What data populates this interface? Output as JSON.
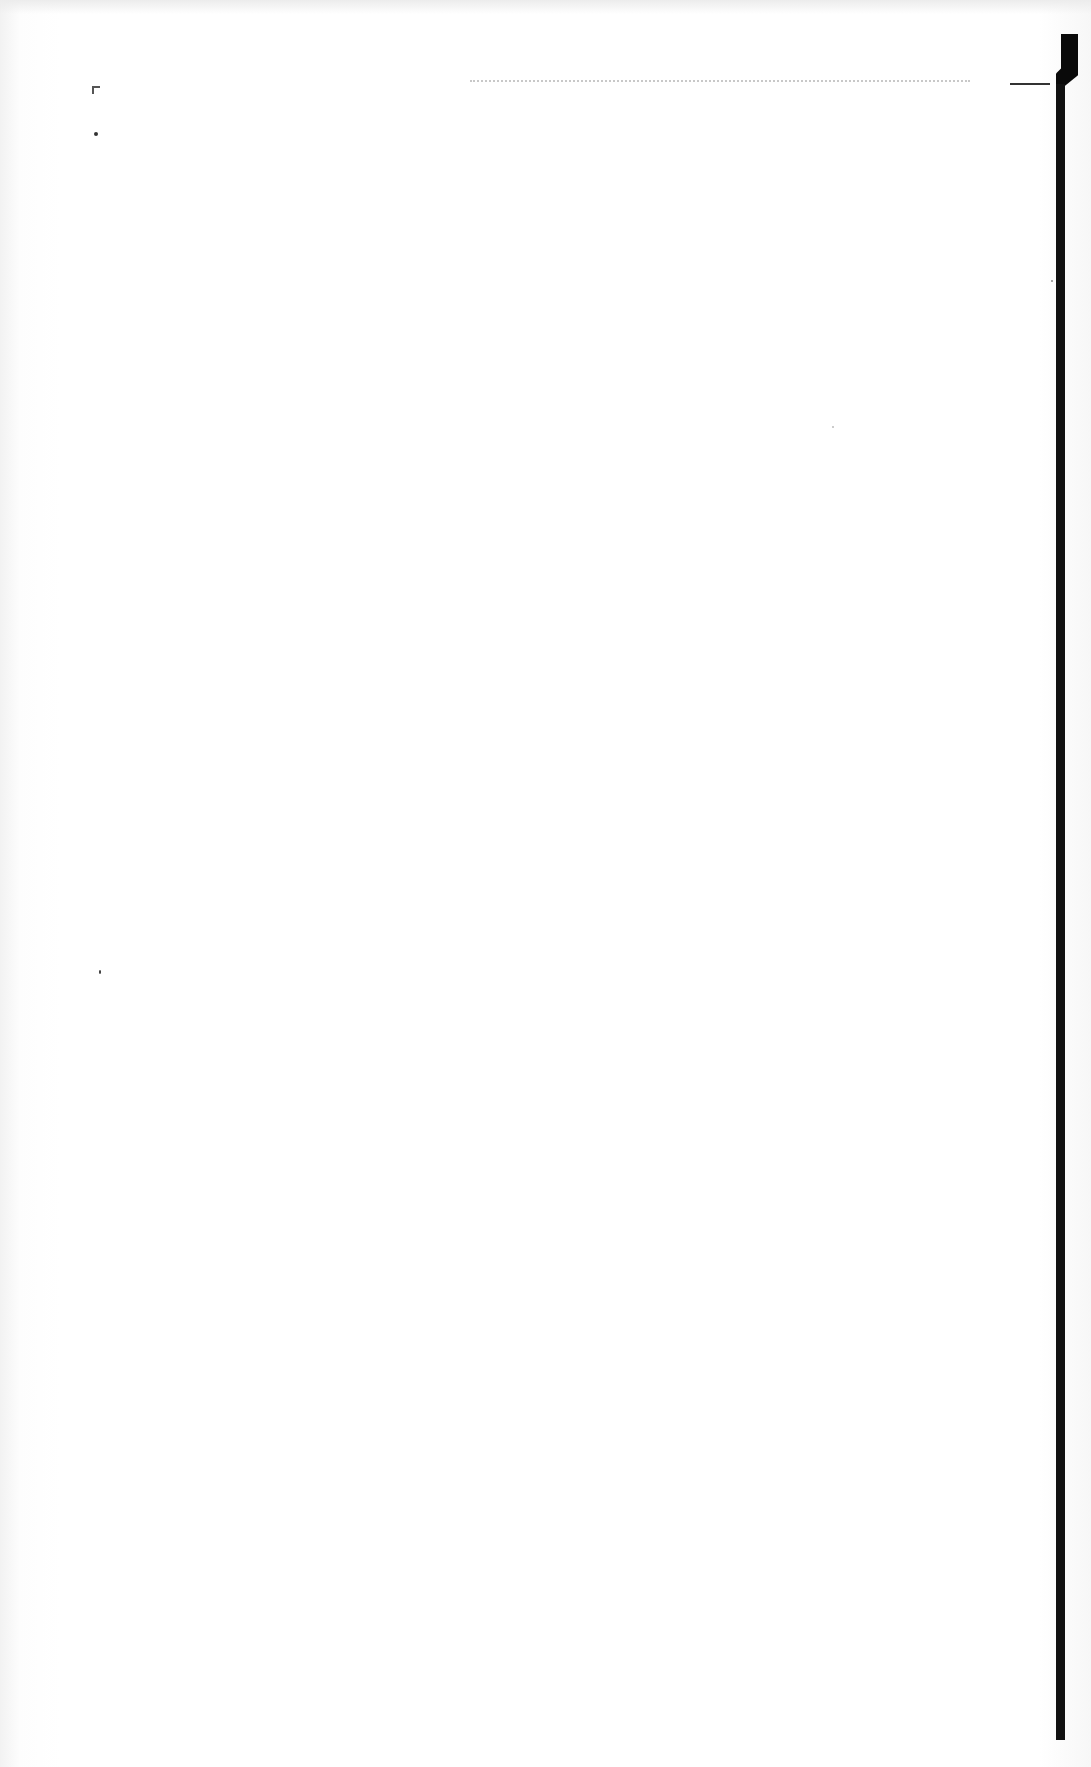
{
  "document": {
    "type": "scanned-blank-page",
    "text_content": "",
    "colors": {
      "paper": "#ffffff",
      "binding_bar": "#111111",
      "dotted_rule": "#c8c8c8"
    }
  },
  "marks": {
    "dotted_rule": "",
    "corner_mark": "",
    "binding_edge": ""
  }
}
